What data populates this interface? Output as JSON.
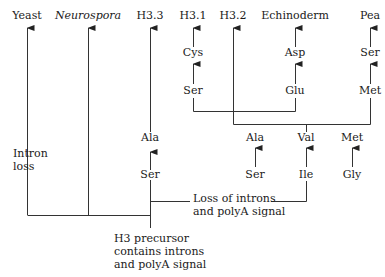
{
  "diagram": {
    "type": "histone H3 gene evolution tree",
    "line_color": "#333333",
    "leaves": {
      "yeast": "Yeast",
      "neurospora": "Neurospora",
      "h33": "H3.3",
      "h31": "H3.1",
      "h32": "H3.2",
      "echinoderm": "Echinoderm",
      "pea": "Pea"
    },
    "substitutions": {
      "h33_upper": "Ala",
      "h33_lower": "Ser",
      "h31_upper": "Cys",
      "h31_lower": "Ser",
      "echinoderm_upper": "Asp",
      "echinoderm_lower": "Glu",
      "pea_upper": "Ser",
      "pea_lower": "Met",
      "mid_1_upper": "Ala",
      "mid_1_lower": "Ser",
      "mid_2_upper": "Val",
      "mid_2_lower": "Ile",
      "mid_3_upper": "Met",
      "mid_3_lower": "Gly"
    },
    "annotations": {
      "intron_loss_line1": "Intron",
      "intron_loss_line2": "loss",
      "loss_introns_line1": "Loss of introns",
      "loss_introns_line2": "and polyA signal",
      "precursor_line1": "H3 precursor",
      "precursor_line2": "contains introns",
      "precursor_line3": "and polyA signal"
    }
  }
}
